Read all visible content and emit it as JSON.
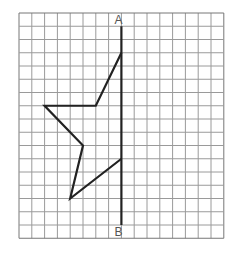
{
  "diagram": {
    "type": "grid-reflection",
    "grid": {
      "cols": 16,
      "rows": 17,
      "origin_x": 19,
      "origin_y": 13,
      "cell_w": 12.8,
      "cell_h": 13.25,
      "line_color": "#9a9a9a",
      "border_color": "#777777"
    },
    "axis": {
      "label_top": "A",
      "label_bottom": "B",
      "col": 8,
      "row_start": 1,
      "row_end": 16,
      "color": "#222222"
    },
    "shape": {
      "color": "#222222",
      "vertices": [
        [
          8,
          3
        ],
        [
          6,
          7
        ],
        [
          2,
          7
        ],
        [
          5,
          10
        ],
        [
          4,
          14
        ],
        [
          8,
          11
        ]
      ]
    }
  }
}
